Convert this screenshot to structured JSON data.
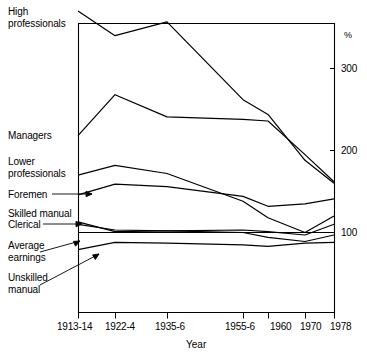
{
  "chart_data": {
    "type": "line",
    "title": "",
    "subtitle": "",
    "xlabel": "Year",
    "ylabel": "",
    "unit_label": "%",
    "legend_position": "inline-left-labels",
    "grid": false,
    "x_axis_side": "bottom",
    "y_axis_side": "right",
    "categories": [
      "1913-14",
      "1922-4",
      "1935-6",
      "1955-6",
      "1960",
      "1970",
      "1978"
    ],
    "x_tick_labels": [
      "1913-14",
      "1922-4",
      "1935-6",
      "1955-6",
      "1960",
      "1970",
      "1978"
    ],
    "y_tick_labels": [
      "100",
      "200",
      "300"
    ],
    "y_ticks": [
      100,
      200,
      300
    ],
    "ylim": [
      30,
      385
    ],
    "series": [
      {
        "name": "High professionals",
        "label": "High professionals",
        "values": [
          370,
          340,
          357,
          262,
          244,
          188,
          160
        ]
      },
      {
        "name": "Managers",
        "label": "Managers",
        "values": [
          218,
          268,
          241,
          238,
          236,
          195,
          162
        ]
      },
      {
        "name": "Lower professionals",
        "label": "Lower professionals",
        "values": [
          170,
          182,
          172,
          138,
          118,
          100,
          120
        ]
      },
      {
        "name": "Foremen",
        "label": "Foremen",
        "values": [
          146,
          159,
          156,
          144,
          132,
          135,
          141
        ]
      },
      {
        "name": "Skilled manual",
        "label": "Skilled manual",
        "values": [
          113,
          101,
          102,
          103,
          101,
          97,
          110
        ]
      },
      {
        "name": "Clerical",
        "label": "Clerical",
        "values": [
          110,
          103,
          102,
          100,
          94,
          89,
          97
        ]
      },
      {
        "name": "Average earnings",
        "label": "Average earnings",
        "values": [
          100,
          100,
          100,
          100,
          100,
          100,
          100
        ]
      },
      {
        "name": "Unskilled manual",
        "label": "Unskilled manual",
        "values": [
          79,
          88,
          87,
          85,
          83,
          87,
          88
        ]
      }
    ]
  },
  "labels": {
    "high_professionals": "High\nprofessionals",
    "managers": "Managers",
    "lower_professionals": "Lower\nprofessionals",
    "foremen": "Foremen",
    "skilled_manual": "Skilled manual",
    "clerical": "Clerical",
    "average_earnings": "Average\nearnings",
    "unskilled_manual": "Unskilled\nmanual"
  },
  "axes": {
    "x_title": "Year",
    "y_unit": "%",
    "x_ticks": [
      "1913-14",
      "1922-4",
      "1935-6",
      "1955-6",
      "1960",
      "1970",
      "1978"
    ],
    "y_ticks": [
      "300",
      "200",
      "100"
    ]
  },
  "colors": {
    "line": "#000000",
    "axis": "#000000",
    "background": "#ffffff",
    "text": "#000000"
  }
}
